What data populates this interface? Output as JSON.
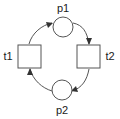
{
  "figure": {
    "type": "petri-net",
    "title": "",
    "background_color": "#ffffff",
    "stroke_color": "#555555",
    "arrowhead_color": "#333333",
    "label_color": "#1a1a1a",
    "width": 120,
    "height": 119
  },
  "places": [
    {
      "id": "p1",
      "label": "p1",
      "shape": "circle",
      "cx": 63,
      "cy": 27,
      "r": 10,
      "label_x": 63,
      "label_y": 12,
      "tokens": 0
    },
    {
      "id": "p2",
      "label": "p2",
      "shape": "circle",
      "cx": 62,
      "cy": 90,
      "r": 10,
      "label_x": 62,
      "label_y": 112,
      "tokens": 0
    }
  ],
  "transitions": [
    {
      "id": "t1",
      "label": "t1",
      "shape": "square",
      "x": 18,
      "y": 45,
      "width": 23,
      "height": 23,
      "label_x": 8,
      "label_y": 60
    },
    {
      "id": "t2",
      "label": "t2",
      "shape": "square",
      "x": 77,
      "y": 45,
      "width": 23,
      "height": 23,
      "label_x": 110,
      "label_y": 60
    }
  ],
  "arcs": [
    {
      "id": "arc-t1-p1",
      "from": "t1",
      "to": "p1",
      "direction": "t1 -> p1",
      "label": ""
    },
    {
      "id": "arc-p1-t2",
      "from": "p1",
      "to": "t2",
      "direction": "p1 -> t2",
      "label": ""
    },
    {
      "id": "arc-t2-p2",
      "from": "t2",
      "to": "p2",
      "direction": "t2 -> p2",
      "label": ""
    },
    {
      "id": "arc-p2-t1",
      "from": "p2",
      "to": "t1",
      "direction": "p2 -> t1",
      "label": ""
    }
  ]
}
